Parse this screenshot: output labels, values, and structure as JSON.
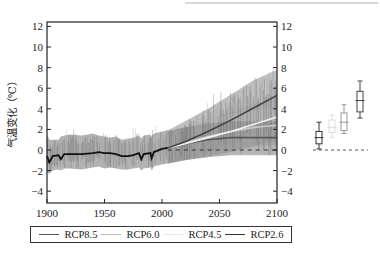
{
  "chart_data": {
    "type": "line",
    "title": "",
    "xlabel": "",
    "ylabel": "气温变化（℃）",
    "xlim": [
      1900,
      2100
    ],
    "ylim": [
      -5,
      12.5
    ],
    "x_ticks": [
      1900,
      1950,
      2000,
      2050,
      2100
    ],
    "y_ticks": [
      -4,
      -2,
      0,
      2,
      4,
      6,
      8,
      10,
      12
    ],
    "y_ticks_right": [
      -4,
      -2,
      0,
      2,
      4,
      6,
      8,
      10,
      12
    ],
    "grid": false,
    "legend_position": "bottom",
    "reference_line": {
      "y": 0,
      "style": "dashed",
      "from": 2005,
      "to": 2100
    },
    "historical": {
      "name": "Historical mean",
      "color": "#111111",
      "x": [
        1900,
        1902,
        1905,
        1910,
        1912,
        1915,
        1920,
        1930,
        1940,
        1945,
        1950,
        1955,
        1960,
        1965,
        1970,
        1975,
        1980,
        1982,
        1984,
        1990,
        1991,
        1993,
        2000,
        2005
      ],
      "y": [
        -0.6,
        -1.2,
        -0.6,
        -0.5,
        -0.9,
        -0.4,
        -0.4,
        -0.4,
        -0.3,
        -0.2,
        -0.3,
        -0.3,
        -0.4,
        -0.6,
        -0.6,
        -0.5,
        -0.3,
        -0.9,
        -0.4,
        -0.3,
        -0.8,
        -0.2,
        0.1,
        0.2
      ],
      "envelope_upper": [
        1.5,
        1.0,
        1.0,
        1.0,
        1.3,
        1.4,
        1.5,
        1.4,
        1.6,
        1.4,
        1.3,
        1.2,
        1.3,
        1.0,
        1.1,
        1.2,
        1.4,
        1.1,
        1.4,
        1.5,
        1.3,
        1.6,
        1.8,
        1.9
      ],
      "envelope_lower": [
        -2.2,
        -2.3,
        -2.0,
        -1.9,
        -2.0,
        -1.8,
        -1.8,
        -1.9,
        -1.7,
        -1.6,
        -1.8,
        -1.7,
        -1.8,
        -1.9,
        -1.9,
        -1.8,
        -1.7,
        -2.0,
        -1.8,
        -1.7,
        -2.0,
        -1.6,
        -1.4,
        -1.3
      ]
    },
    "series": [
      {
        "name": "RCP8.5",
        "color": "#555555",
        "x": [
          2005,
          2020,
          2040,
          2060,
          2080,
          2100
        ],
        "values": [
          0.2,
          0.8,
          1.8,
          2.9,
          4.1,
          5.3
        ],
        "upper": [
          1.9,
          2.8,
          4.0,
          5.4,
          6.8,
          7.8
        ],
        "lower": [
          -1.3,
          -0.9,
          -0.2,
          0.6,
          1.5,
          2.6
        ]
      },
      {
        "name": "RCP6.0",
        "color": "#bbbbbb",
        "x": [
          2005,
          2020,
          2040,
          2060,
          2080,
          2100
        ],
        "values": [
          0.2,
          0.6,
          1.2,
          1.8,
          2.5,
          3.2
        ],
        "upper": [
          1.8,
          2.3,
          3.0,
          3.7,
          4.5,
          5.2
        ],
        "lower": [
          -1.3,
          -1.0,
          -0.6,
          -0.2,
          0.4,
          1.0
        ]
      },
      {
        "name": "RCP4.5",
        "color": "#e6e6e6",
        "x": [
          2005,
          2020,
          2040,
          2060,
          2080,
          2100
        ],
        "values": [
          0.2,
          0.7,
          1.3,
          1.8,
          2.2,
          2.4
        ],
        "upper": [
          1.8,
          2.3,
          3.0,
          3.5,
          3.9,
          4.1
        ],
        "lower": [
          -1.3,
          -0.9,
          -0.5,
          -0.1,
          0.3,
          0.5
        ]
      },
      {
        "name": "RCP2.6",
        "color": "#333333",
        "x": [
          2005,
          2020,
          2040,
          2060,
          2080,
          2100
        ],
        "values": [
          0.2,
          0.6,
          1.0,
          1.2,
          1.2,
          1.2
        ],
        "upper": [
          1.8,
          2.2,
          2.6,
          2.8,
          2.8,
          2.8
        ],
        "lower": [
          -1.3,
          -1.0,
          -0.7,
          -0.5,
          -0.5,
          -0.5
        ]
      }
    ],
    "boxplots": {
      "description": "Year-2100 warming distribution per scenario",
      "reference_line": {
        "y": 0,
        "style": "dashed"
      },
      "items": [
        {
          "name": "RCP2.6",
          "color": "#333333",
          "whisker_low": 0.1,
          "q1": 0.6,
          "median": 1.2,
          "q3": 1.8,
          "whisker_high": 2.7
        },
        {
          "name": "RCP4.5",
          "color": "#dddddd",
          "whisker_low": 1.2,
          "q1": 1.7,
          "median": 2.2,
          "q3": 2.9,
          "whisker_high": 3.4
        },
        {
          "name": "RCP6.0",
          "color": "#999999",
          "whisker_low": 1.6,
          "q1": 1.9,
          "median": 2.7,
          "q3": 3.6,
          "whisker_high": 4.4
        },
        {
          "name": "RCP8.5",
          "color": "#444444",
          "whisker_low": 3.1,
          "q1": 3.7,
          "median": 4.8,
          "q3": 5.7,
          "whisker_high": 6.7
        }
      ]
    }
  },
  "legend": {
    "items": [
      {
        "label": "RCP8.5",
        "color": "#555555"
      },
      {
        "label": "RCP6.0",
        "color": "#bbbbbb"
      },
      {
        "label": "RCP4.5",
        "color": "#e8e8e8"
      },
      {
        "label": "RCP2.6",
        "color": "#333333"
      }
    ]
  },
  "axis": {
    "ylabel": "气温变化（℃）"
  }
}
